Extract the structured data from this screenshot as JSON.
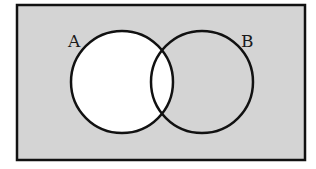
{
  "diagram": {
    "type": "venn",
    "universe": {
      "x": 17,
      "y": 5,
      "width": 288,
      "height": 155,
      "fill": "#d4d4d4",
      "stroke": "#111111"
    },
    "sets": [
      {
        "name": "A",
        "label": "A",
        "cx": 122,
        "cy": 82,
        "r": 51,
        "fill": "#ffffff",
        "label_x": 68,
        "label_y": 47
      },
      {
        "name": "B",
        "label": "B",
        "cx": 202,
        "cy": 82,
        "r": 51,
        "fill": "none",
        "label_x": 241,
        "label_y": 47
      }
    ],
    "highlighted_region": "A",
    "colors": {
      "shaded": "#d4d4d4",
      "unshaded": "#ffffff",
      "outline": "#111111"
    }
  }
}
